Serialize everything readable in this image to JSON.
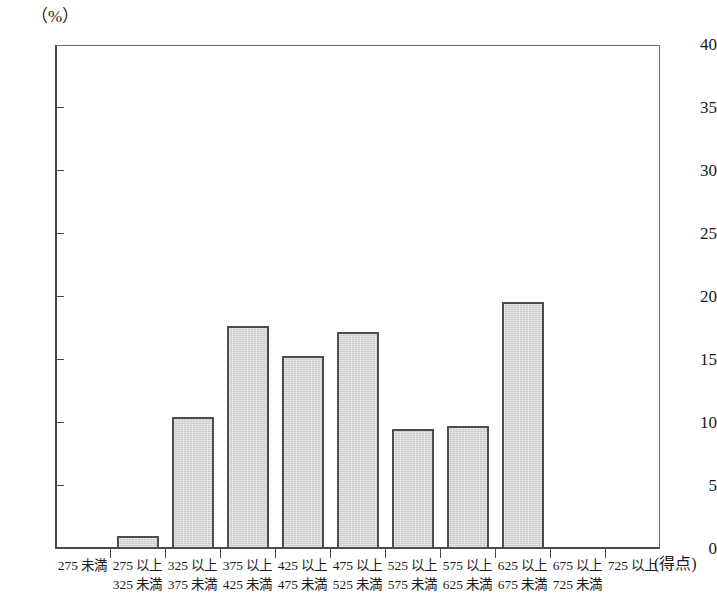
{
  "chart_data": {
    "type": "bar",
    "title": "",
    "subtitle": "",
    "xlabel": "(得点)",
    "ylabel": "(%)",
    "ylim": [
      0,
      40
    ],
    "yticks": [
      0,
      5,
      10,
      15,
      20,
      25,
      30,
      35,
      40
    ],
    "ytick_labels": [
      "0",
      "5",
      "10",
      "15",
      "20",
      "25",
      "30",
      "35",
      "40"
    ],
    "grid": false,
    "legend": null,
    "categories": [
      "275 未満",
      "275 以上\n325 未満",
      "325 以上\n375 未満",
      "375 以上\n425 未満",
      "425 以上\n475 未満",
      "475 以上\n525 未満",
      "525 以上\n575 未満",
      "575 以上\n625 未満",
      "625 以上\n675 未満",
      "675 以上\n725 未満",
      "725 以上"
    ],
    "category_lines": [
      [
        "275 未満",
        ""
      ],
      [
        "275 以上",
        "325 未満"
      ],
      [
        "325 以上",
        "375 未満"
      ],
      [
        "375 以上",
        "425 未満"
      ],
      [
        "425 以上",
        "475 未満"
      ],
      [
        "475 以上",
        "525 未満"
      ],
      [
        "525 以上",
        "575 未満"
      ],
      [
        "575 以上",
        "625 未満"
      ],
      [
        "625 以上",
        "675 未満"
      ],
      [
        "675 以上",
        "725 未満"
      ],
      [
        "725 以上",
        ""
      ]
    ],
    "values": [
      0,
      1.0,
      10.5,
      17.7,
      15.3,
      17.2,
      9.5,
      9.8,
      19.6,
      0,
      0
    ],
    "bar_color": "#c9c9c9",
    "bar_edge_color": "#4d4d4d",
    "axis_color": "#4a4a4a"
  },
  "top_caption": "",
  "axis": {
    "y_unit": "（%）",
    "x_unit": "(得点)"
  }
}
